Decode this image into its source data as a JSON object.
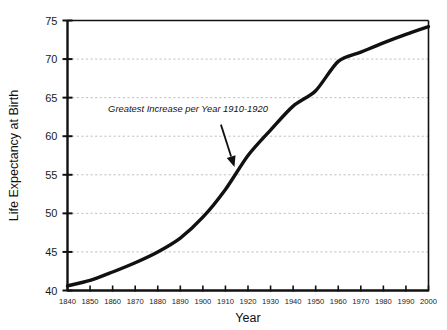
{
  "chart_data": {
    "type": "line",
    "title": "",
    "xlabel": "Year",
    "ylabel": "Life Expectancy at Birth",
    "xlim": [
      1840,
      2000
    ],
    "ylim": [
      40,
      75
    ],
    "grid": true,
    "grid_axis": "y",
    "legend": "none",
    "line_color": "#111111",
    "x": [
      1840,
      1850,
      1860,
      1870,
      1880,
      1890,
      1900,
      1910,
      1920,
      1930,
      1940,
      1950,
      1960,
      1970,
      1980,
      1990,
      2000
    ],
    "values": [
      40.6,
      41.3,
      42.4,
      43.6,
      45.0,
      46.8,
      49.5,
      53.1,
      57.5,
      60.8,
      63.9,
      65.9,
      69.7,
      70.9,
      72.1,
      73.2,
      74.2
    ],
    "categories": [
      "1840",
      "1850",
      "1860",
      "1870",
      "1880",
      "1890",
      "1900",
      "1910",
      "1920",
      "1930",
      "1940",
      "1950",
      "1960",
      "1970",
      "1980",
      "1990",
      "2000"
    ],
    "xticks": [
      1840,
      1850,
      1860,
      1870,
      1880,
      1890,
      1900,
      1910,
      1920,
      1930,
      1940,
      1950,
      1960,
      1970,
      1980,
      1990,
      2000
    ],
    "xtick_labels": [
      "1840",
      "1850",
      "1860",
      "1870",
      "1880",
      "1890",
      "1900",
      "1910",
      "1920",
      "1930",
      "1940",
      "1950",
      "1960",
      "1970",
      "1980",
      "1990",
      "2000"
    ],
    "yticks": [
      40,
      45,
      50,
      55,
      60,
      65,
      70,
      75
    ],
    "ytick_labels": [
      "40",
      "45",
      "50",
      "55",
      "60",
      "65",
      "70",
      "75"
    ],
    "annotations": [
      {
        "text": "Greatest Increase per Year 1910-1920",
        "style": "italic",
        "text_x": 1858,
        "text_y": 63.2,
        "arrow_from_x": 1908,
        "arrow_from_y": 61.5,
        "arrow_to_x": 1914,
        "arrow_to_y": 56.0
      }
    ]
  },
  "axes": {
    "ylabel": "Life Expectancy at Birth",
    "xlabel": "Year"
  },
  "annotation": {
    "label": "Greatest Increase per Year 1910-1920"
  },
  "colors": {
    "line": "#111111",
    "axis": "#111111",
    "grid": "#b9b9b9",
    "text": "#111111",
    "background": "#ffffff"
  }
}
